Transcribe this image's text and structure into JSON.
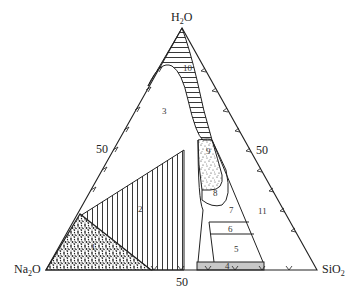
{
  "diagram": {
    "type": "ternary phase diagram",
    "vertices": {
      "top": {
        "main": "H",
        "sub": "2",
        "tail": "O"
      },
      "left": {
        "main": "Na",
        "sub": "2",
        "tail": "O"
      },
      "right": {
        "main": "SiO",
        "sub": "2",
        "tail": ""
      }
    },
    "axis_labels": {
      "left": "50",
      "right": "50",
      "bottom": "50"
    },
    "regions": [
      {
        "id": "1",
        "label": "1",
        "fill": "stipple"
      },
      {
        "id": "2",
        "label": "2",
        "fill": "vertical-hatch"
      },
      {
        "id": "3",
        "label": "3",
        "fill": "none"
      },
      {
        "id": "4",
        "label": "4",
        "fill": "grey"
      },
      {
        "id": "5",
        "label": "5",
        "fill": "none"
      },
      {
        "id": "6",
        "label": "6",
        "fill": "none"
      },
      {
        "id": "7",
        "label": "7",
        "fill": "none"
      },
      {
        "id": "8",
        "label": "8",
        "fill": "none"
      },
      {
        "id": "9",
        "label": "9",
        "fill": "stipple"
      },
      {
        "id": "10",
        "label": "10",
        "fill": "horizontal-hatch"
      },
      {
        "id": "11",
        "label": "11",
        "fill": "none"
      }
    ],
    "colors": {
      "line": "#222222",
      "grey_fill": "#c8c8c8",
      "background": "#ffffff"
    }
  }
}
